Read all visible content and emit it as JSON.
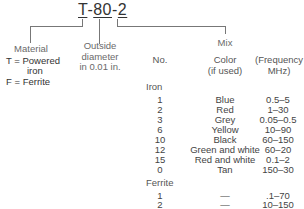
{
  "part_number": {
    "t": "T",
    "dash1": "-",
    "size": "80",
    "dash2": "-",
    "mix": "2"
  },
  "labels": {
    "material": "Material",
    "outside_diameter": [
      "Outside",
      "diameter",
      "in 0.01 in."
    ],
    "mix": "Mix"
  },
  "material_codes": [
    {
      "code": "T =",
      "desc": "Powered",
      "desc2": "iron"
    },
    {
      "code": "F =",
      "desc": "Ferrite"
    }
  ],
  "table": {
    "headers": {
      "no": "No.",
      "color": [
        "Color",
        "(if used)"
      ],
      "frequency": [
        "(Frequency",
        "MHz)"
      ]
    },
    "groups": [
      {
        "name": "Iron",
        "rows": [
          {
            "no": "1",
            "color": "Blue",
            "freq": "0.5–5"
          },
          {
            "no": "2",
            "color": "Red",
            "freq": "1–30"
          },
          {
            "no": "3",
            "color": "Grey",
            "freq": "0.05–0.5"
          },
          {
            "no": "6",
            "color": "Yellow",
            "freq": "10–90"
          },
          {
            "no": "10",
            "color": "Black",
            "freq": "60–150"
          },
          {
            "no": "12",
            "color": "Green and white",
            "freq": "60–20"
          },
          {
            "no": "15",
            "color": "Red and white",
            "freq": "0.1–2"
          },
          {
            "no": "0",
            "color": "Tan",
            "freq": "150–30"
          }
        ]
      },
      {
        "name": "Ferrite",
        "rows": [
          {
            "no": "1",
            "color": "—",
            "freq": ".1–70"
          },
          {
            "no": "2",
            "color": "—",
            "freq": "10–150"
          }
        ]
      }
    ]
  }
}
